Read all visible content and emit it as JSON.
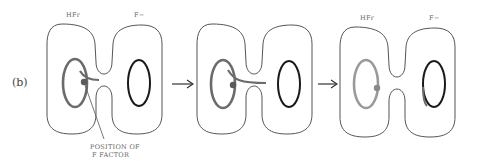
{
  "figure": {
    "part_label": "(b)",
    "annotation": {
      "line1": "POSITION OF",
      "line2": "F FACTOR"
    },
    "panels": [
      {
        "left_cell_label": "HFr",
        "right_cell_label": "F−",
        "stage": "F factor integrated in Hfr chromosome",
        "labels_visible": true
      },
      {
        "left_cell_label": "",
        "right_cell_label": "",
        "stage": "chromosome transfer begins through conjugation bridge",
        "labels_visible": false
      },
      {
        "left_cell_label": "HFr",
        "right_cell_label": "F−",
        "stage": "after transfer, recipient chromosome partially converted",
        "labels_visible": true
      }
    ],
    "arrows": [
      "arrow-1-to-2",
      "arrow-2-to-3"
    ],
    "colors": {
      "outline": "#555555",
      "hfr_chromosome": "#6b6b6b",
      "hfr_chromosome_light": "#9a9a9a",
      "f_minus_chromosome": "#1a1a1a",
      "f_factor_dot": "#5a5a5a"
    }
  }
}
